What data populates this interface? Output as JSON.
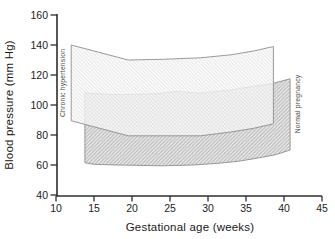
{
  "chart_data": {
    "type": "area",
    "title": "",
    "xlabel": "Gestational age (weeks)",
    "ylabel": "Blood pressure (mm Hg)",
    "xlim": [
      10,
      45
    ],
    "ylim": [
      40,
      160
    ],
    "x_ticks": [
      10,
      15,
      20,
      25,
      30,
      35,
      40,
      45
    ],
    "y_ticks": [
      40,
      60,
      80,
      100,
      120,
      140,
      160
    ],
    "grid": false,
    "legend_position": "rotated labels at band edges",
    "series": [
      {
        "name": "Chronic hypertension",
        "role": "band",
        "fill": "white",
        "units": "weeks -> mm Hg",
        "upper": [
          [
            12,
            140
          ],
          [
            19.5,
            130
          ],
          [
            24,
            130.5
          ],
          [
            29,
            131.5
          ],
          [
            33,
            133.5
          ],
          [
            36,
            136
          ],
          [
            38.6,
            139
          ]
        ],
        "lower": [
          [
            12,
            89.5
          ],
          [
            19.5,
            79.5
          ],
          [
            23,
            79.5
          ],
          [
            29,
            79.5
          ],
          [
            33,
            82
          ],
          [
            36,
            84.5
          ],
          [
            38.6,
            87.5
          ]
        ]
      },
      {
        "name": "Normal pregnancy",
        "role": "band",
        "fill": "diagonal-hatch",
        "units": "weeks -> mm Hg",
        "upper": [
          [
            13.8,
            108
          ],
          [
            17,
            107
          ],
          [
            20,
            107
          ],
          [
            23,
            107.5
          ],
          [
            26,
            109
          ],
          [
            28.5,
            108
          ],
          [
            30,
            108.5
          ],
          [
            33,
            110
          ],
          [
            36,
            112.5
          ],
          [
            38.6,
            114.5
          ],
          [
            40.8,
            117.5
          ]
        ],
        "lower": [
          [
            13.8,
            61.5
          ],
          [
            15,
            60.5
          ],
          [
            18,
            60
          ],
          [
            24,
            59.5
          ],
          [
            28,
            60
          ],
          [
            31,
            61
          ],
          [
            34,
            62.5
          ],
          [
            37,
            65
          ],
          [
            39,
            67
          ],
          [
            40.8,
            70
          ]
        ]
      }
    ]
  },
  "colors": {
    "axis": "#2e2e2e",
    "tick_label": "#1c1c1c",
    "band_outline": "#8f8f8f",
    "hatch_line": "#b2b2b2",
    "hatch_bg": "#ececec",
    "band_label": "#4a4a4a"
  }
}
